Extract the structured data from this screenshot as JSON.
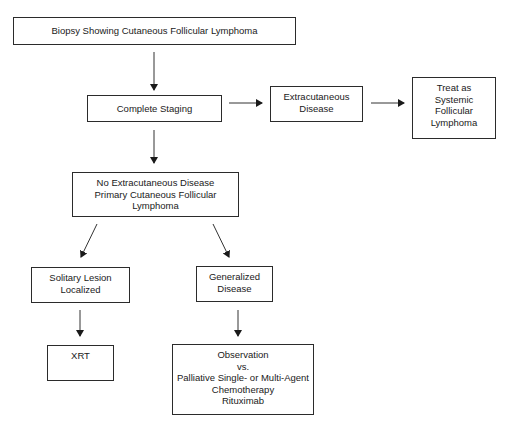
{
  "diagram": {
    "type": "flowchart",
    "nodes": {
      "biopsy": {
        "lines": [
          "Biopsy Showing Cutaneous Follicular Lymphoma"
        ]
      },
      "staging": {
        "lines": [
          "Complete Staging"
        ]
      },
      "extracutaneous": {
        "lines": [
          "Extracutaneous",
          "Disease"
        ]
      },
      "systemic": {
        "lines": [
          "Treat as",
          "Systemic",
          "Follicular",
          "Lymphoma"
        ]
      },
      "primary": {
        "lines": [
          "No Extracutaneous Disease",
          "Primary Cutaneous Follicular",
          "Lymphoma"
        ]
      },
      "solitary": {
        "lines": [
          "Solitary Lesion",
          "Localized"
        ]
      },
      "generalized": {
        "lines": [
          "Generalized",
          "Disease"
        ]
      },
      "xrt": {
        "lines": [
          "XRT"
        ]
      },
      "observation": {
        "lines": [
          "Observation",
          "vs.",
          "Palliative Single- or Multi-Agent",
          "Chemotherapy",
          "Rituximab"
        ]
      }
    },
    "edges": [
      [
        "biopsy",
        "staging"
      ],
      [
        "staging",
        "extracutaneous"
      ],
      [
        "extracutaneous",
        "systemic"
      ],
      [
        "staging",
        "primary"
      ],
      [
        "primary",
        "solitary"
      ],
      [
        "primary",
        "generalized"
      ],
      [
        "solitary",
        "xrt"
      ],
      [
        "generalized",
        "observation"
      ]
    ],
    "colors": {
      "stroke": "#2b2b2b",
      "background": "#ffffff"
    }
  }
}
